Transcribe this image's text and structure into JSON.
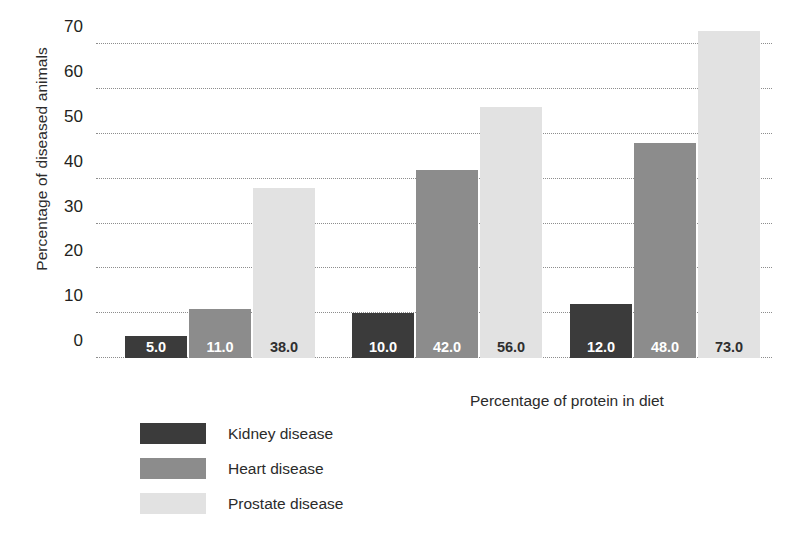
{
  "chart_data": {
    "type": "bar",
    "title": "",
    "xlabel": "Percentage of protein in diet",
    "ylabel": "Percentage of diseased animals",
    "categories": [
      "Low protein",
      "Medium protein",
      "High protein"
    ],
    "series": [
      {
        "name": "Kidney disease",
        "color": "#3b3b3b",
        "label_color": "#ffffff",
        "values": [
          5.0,
          10.0,
          12.0
        ],
        "value_labels": [
          "5.0",
          "10.0",
          "12.0"
        ]
      },
      {
        "name": "Heart disease",
        "color": "#8c8c8c",
        "label_color": "#ffffff",
        "values": [
          11.0,
          42.0,
          48.0
        ],
        "value_labels": [
          "11.0",
          "42.0",
          "48.0"
        ]
      },
      {
        "name": "Prostate disease",
        "color": "#e2e2e2",
        "label_color": "#2f2f2f",
        "values": [
          38.0,
          56.0,
          73.0
        ],
        "value_labels": [
          "38.0",
          "56.0",
          "73.0"
        ]
      }
    ],
    "ylim": [
      0,
      75
    ],
    "yticks": [
      0,
      10,
      20,
      30,
      40,
      50,
      60,
      70
    ],
    "ytick_labels": [
      "0",
      "10",
      "20",
      "30",
      "40",
      "50",
      "60",
      "70"
    ],
    "xtick_labels": [
      "",
      "",
      ""
    ],
    "grid": "horizontal-dotted",
    "legend_position": "below-left"
  },
  "legend": {
    "items": [
      {
        "label": "Kidney disease",
        "color": "#3b3b3b"
      },
      {
        "label": "Heart disease",
        "color": "#8c8c8c"
      },
      {
        "label": "Prostate disease",
        "color": "#e2e2e2"
      }
    ]
  },
  "colors": {
    "background": "#ffffff",
    "text": "#231f20",
    "gridline": "#8d8d8d"
  }
}
